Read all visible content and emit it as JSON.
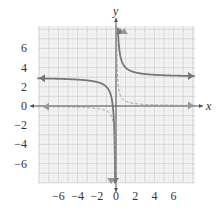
{
  "chart_data": {
    "type": "line",
    "title": "",
    "xlabel": "x",
    "ylabel": "y",
    "xlim": [
      -8,
      8
    ],
    "ylim": [
      -8,
      8
    ],
    "grid": true,
    "x_ticks": [
      -6,
      -4,
      -2,
      0,
      2,
      4,
      6
    ],
    "y_ticks": [
      6,
      4,
      2,
      0,
      -2,
      -4,
      -6
    ],
    "x_tick_labels": [
      "−6",
      "−4",
      "−2",
      "0",
      "2",
      "4",
      "6"
    ],
    "y_tick_labels": [
      "6",
      "4",
      "2",
      "0",
      "−2",
      "−4",
      "−6"
    ],
    "series": [
      {
        "name": "solid curve",
        "style": "solid",
        "color": "#777777",
        "formula": "y = 3 + 1/x",
        "horizontal_asymptote": 3,
        "vertical_asymptote": 0
      },
      {
        "name": "dashed curve",
        "style": "dashed",
        "color": "#999999",
        "formula": "y = 1/(2x)",
        "horizontal_asymptote": 0,
        "vertical_asymptote": 0
      }
    ]
  },
  "axes": {
    "x_label": "x",
    "y_label": "y"
  },
  "colors": {
    "grid_major": "#d0d0d0",
    "grid_minor": "#e6e6e6",
    "grid_bg": "#f3f3f3",
    "axis": "#555555"
  }
}
